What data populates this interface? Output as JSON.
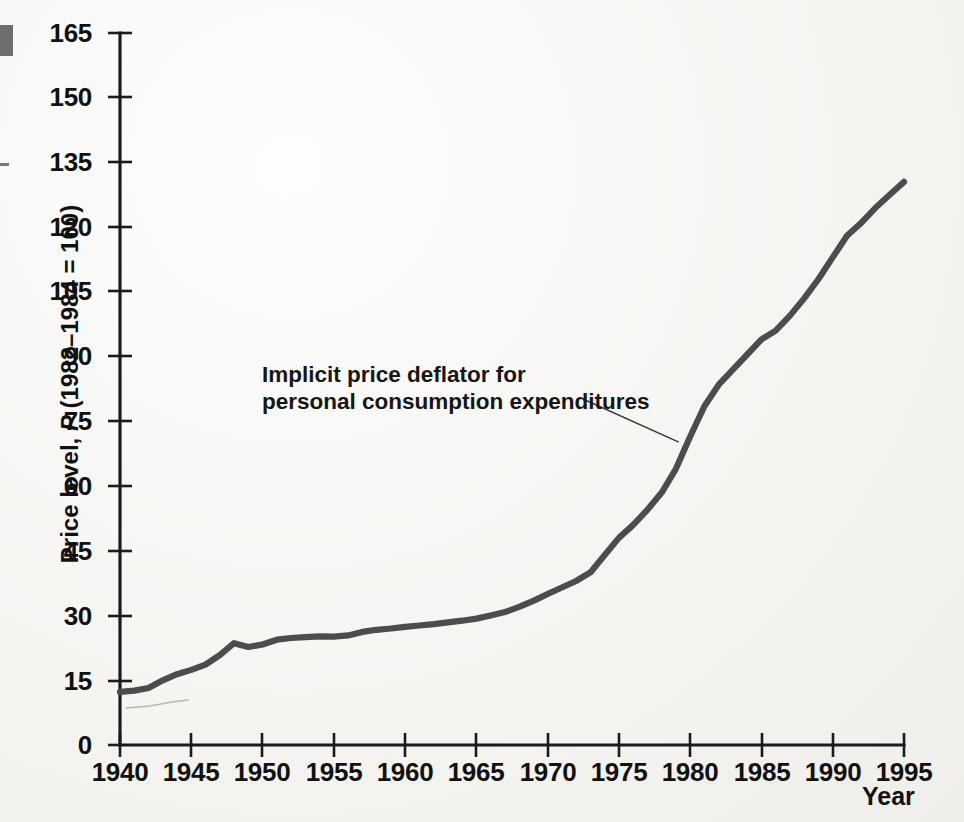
{
  "figure": {
    "background_color": "#f7f6f4",
    "curve_color": "#4c4c4c",
    "axis_color": "#1b1b1b",
    "edge_mark_block_name": "page-edge-block",
    "edge_mark_dash_name": "page-edge-dash"
  },
  "annotation": {
    "line1": "Implicit price deflator for",
    "line2": "personal consumption expenditures"
  },
  "axis_titles": {
    "y_prefix": "Price level, ",
    "y_italic": "P",
    "y_suffix": " (1982–1984 = 100)",
    "y_full": "Price level, P (1982–1984 = 100)",
    "x": "Year"
  },
  "chart_data": {
    "type": "line",
    "title": "",
    "subtitle": "",
    "xlabel": "Year",
    "ylabel": "Price level, P (1982–1984 = 100)",
    "xlim": [
      1940,
      1995
    ],
    "ylim": [
      0,
      165
    ],
    "grid": false,
    "legend_position": "none",
    "xticks": [
      1940,
      1945,
      1950,
      1955,
      1960,
      1965,
      1970,
      1975,
      1980,
      1985,
      1990,
      1995
    ],
    "yticks": [
      0,
      15,
      30,
      45,
      60,
      75,
      90,
      105,
      120,
      135,
      150,
      165
    ],
    "annotations": [
      {
        "text": "Implicit price deflator for personal consumption expenditures",
        "points_to_x": 1979.2,
        "points_to_y": 70.2
      }
    ],
    "series": [
      {
        "name": "Implicit price deflator for personal consumption expenditures",
        "color": "#4c4c4c",
        "x": [
          1940,
          1941,
          1942,
          1943,
          1944,
          1945,
          1946,
          1947,
          1948,
          1949,
          1950,
          1951,
          1952,
          1953,
          1954,
          1955,
          1956,
          1957,
          1958,
          1959,
          1960,
          1961,
          1962,
          1963,
          1964,
          1965,
          1966,
          1967,
          1968,
          1969,
          1970,
          1971,
          1972,
          1973,
          1974,
          1975,
          1976,
          1977,
          1978,
          1979,
          1980,
          1981,
          1982,
          1983,
          1984,
          1985,
          1986,
          1987,
          1988,
          1989,
          1990,
          1991,
          1992,
          1993,
          1994,
          1995
        ],
        "values": [
          12.3,
          12.6,
          13.2,
          15.0,
          16.4,
          17.4,
          18.6,
          20.8,
          23.6,
          22.7,
          23.3,
          24.4,
          24.8,
          25.0,
          25.2,
          25.1,
          25.4,
          26.2,
          26.7,
          27.0,
          27.4,
          27.7,
          28.0,
          28.4,
          28.8,
          29.3,
          30.0,
          30.8,
          32.0,
          33.4,
          35.0,
          36.5,
          38.0,
          40.0,
          44.0,
          48.0,
          51.0,
          54.5,
          58.5,
          64.0,
          71.5,
          78.5,
          83.5,
          87.0,
          90.5,
          94.0,
          96.0,
          99.5,
          103.5,
          108.0,
          113.0,
          118.0,
          121.0,
          124.5,
          127.5,
          130.5
        ]
      }
    ]
  },
  "plot_geometry": {
    "x_axis_left_px": 120,
    "x_axis_right_px": 904,
    "y_axis_top_px": 33,
    "y_axis_bottom_px": 745,
    "value_top": 165,
    "value_bottom": 0
  },
  "curve_pixel_path": "M120,692 L134,688 L148,683 L162,670 L176,661 L190,655 L204,647 L218,645 L228,641 L238,649 L248,648 L262,646 L276,643 L290,641 L304,639 L318,638 L325,636 L332,640 L340,634 L354,631 L368,629 L382,627 L396,625 L410,623 L424,620 L438,617 L452,613 L466,609 L480,603 L494,596 L508,589 L522,582 L536,575 L550,566 L564,551 L578,534 L592,522 L606,511 L620,498 L634,479 L648,452 L662,411 L676,382 L690,365 L700,348 L714,333 L728,323 L742,308 L756,292 L770,273 L784,252 L798,233 L812,221 L826,207 L840,192 L854,176 L868,155 L882,133 L896,112 L910,98",
  "ghost_pixel_path": "M126,708 L150,706 L172,702 L188,700",
  "leader_pixel_path": "M583,399 L678,442"
}
